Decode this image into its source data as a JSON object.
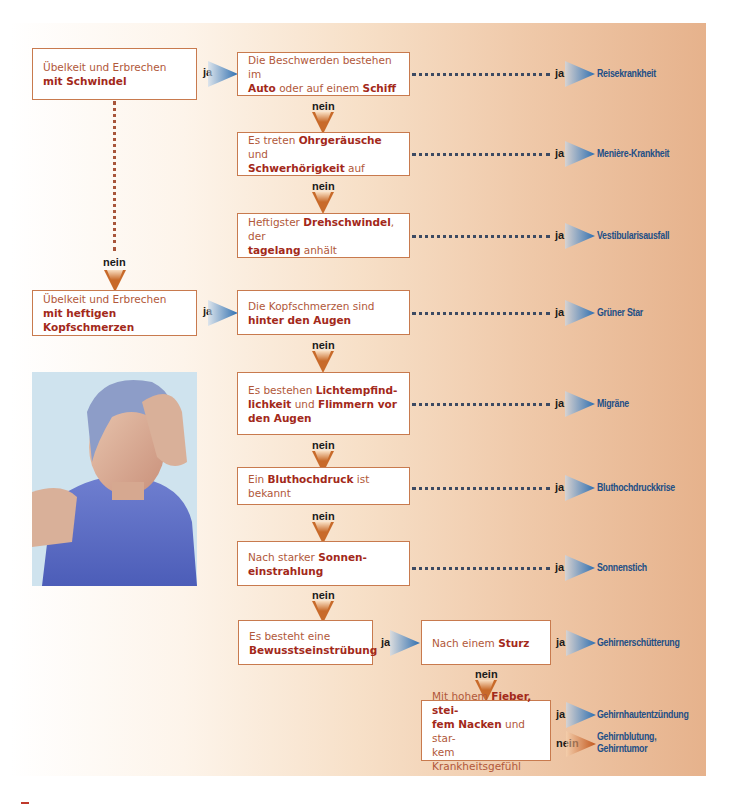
{
  "flowchart": {
    "start_nodes": [
      {
        "id": "s1",
        "text_plain": "Übelkeit und Erbrechen ",
        "text_bold": "mit Schwindel"
      },
      {
        "id": "s2",
        "text_plain": "Übelkeit und Erbrechen ",
        "text_bold": "mit heftigen Kopfschmerzen"
      }
    ],
    "questions": [
      {
        "id": "q1",
        "parts": [
          "Die Beschwerden bestehen im ",
          "Auto",
          " oder auf einem ",
          "Schiff"
        ],
        "result": "Reisekrankheit"
      },
      {
        "id": "q2",
        "parts": [
          "Es treten ",
          "Ohrgeräusche",
          " und ",
          "Schwerhörigkeit",
          " auf"
        ],
        "result": "Menière-Krankheit"
      },
      {
        "id": "q3",
        "parts": [
          "Heftigster ",
          "Drehschwindel",
          ", der ",
          "tagelang",
          " anhält"
        ],
        "result": "Vestibularisausfall"
      },
      {
        "id": "q4",
        "parts": [
          "Die Kopfschmerzen sind ",
          "hinter den Augen"
        ],
        "result": "Grüner Star"
      },
      {
        "id": "q5",
        "parts": [
          "Es bestehen ",
          "Lichtempfind-lichkeit",
          " und ",
          "Flimmern vor den Augen"
        ],
        "result": "Migräne"
      },
      {
        "id": "q6",
        "parts": [
          "Ein ",
          "Bluthochdruck",
          " ist bekannt"
        ],
        "result": "Bluthochdruckkrise"
      },
      {
        "id": "q7",
        "parts": [
          "Nach starker ",
          "Sonnen-einstrahlung"
        ],
        "result": "Sonnenstich"
      },
      {
        "id": "q8",
        "parts": [
          "Es besteht eine ",
          "Bewusstseinstrübung"
        ]
      },
      {
        "id": "q9",
        "parts": [
          "Nach einem ",
          "Sturz"
        ],
        "result": "Gehirnerschütterung"
      },
      {
        "id": "q10",
        "parts": [
          "Mit hohem ",
          "Fieber, stei-fem Nacken",
          " und star-kem Krankheitsgefühl"
        ],
        "result_yes": "Gehirnhautentzündung",
        "result_no": "Gehirnblutung, Gehirntumor"
      }
    ],
    "labels": {
      "yes": "ja",
      "no": "nein"
    }
  },
  "image": {
    "description": "Frau mit Kopfschmerzen, Hand an der Stirn"
  },
  "colors": {
    "box_border": "#c87a4e",
    "text": "#b1583a",
    "bold_text": "#a3291a",
    "result_text": "#234f86",
    "arrow_blue": "#2f6fb0",
    "arrow_orange": "#c86a2a",
    "bg_right": "#e6b28c"
  }
}
